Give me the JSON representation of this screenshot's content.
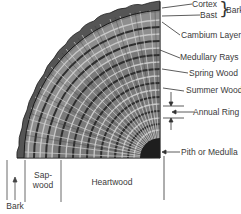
{
  "diagram": {
    "right_labels": [
      {
        "id": "cortex",
        "text": "Cortex"
      },
      {
        "id": "bast",
        "text": "Bast"
      },
      {
        "id": "bark_group",
        "text": "Bark"
      },
      {
        "id": "cambium",
        "text": "Cambium Layer"
      },
      {
        "id": "medullary",
        "text": "Medullary Rays"
      },
      {
        "id": "spring",
        "text": "Spring Wood"
      },
      {
        "id": "summer",
        "text": "Summer Wood"
      },
      {
        "id": "annual",
        "text": "Annual Ring"
      },
      {
        "id": "pith",
        "text": "Pith or Medulla"
      }
    ],
    "bottom_labels": [
      {
        "id": "bark_bottom",
        "text": "Bark"
      },
      {
        "id": "sapwood",
        "text": "Sap-\nwood"
      },
      {
        "id": "heartwood",
        "text": "Heartwood"
      }
    ],
    "colors": {
      "wood_dark": "#2a2a2a",
      "wood_mid": "#6e6e6e",
      "wood_light": "#b8b8b8",
      "line": "#333333",
      "background": "#ffffff"
    }
  }
}
